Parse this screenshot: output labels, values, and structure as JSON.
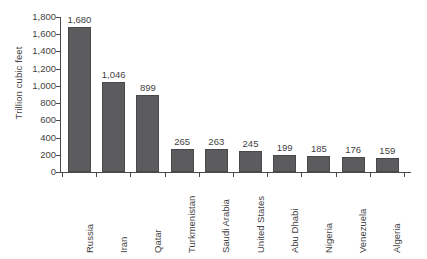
{
  "chart_data": {
    "type": "bar",
    "title": "",
    "subtitle": "",
    "xlabel": "",
    "ylabel": "Trillion cubic feet",
    "ylim": [
      0,
      1800
    ],
    "ytick_step": 200,
    "ytick_labels": [
      "1,800",
      "1,600",
      "1,400",
      "1,200",
      "1,000",
      "800",
      "600",
      "400",
      "200",
      "0"
    ],
    "ytick_values": [
      1800,
      1600,
      1400,
      1200,
      1000,
      800,
      600,
      400,
      200,
      0
    ],
    "grid": false,
    "legend": false,
    "bar_color": "#5c5c5e",
    "axis_color": "#4a4a4a",
    "text_color": "#3f3f3f",
    "background": "#ffffff",
    "categories": [
      "Russia",
      "Iran",
      "Qatar",
      "Turkmenistan",
      "Saudi Arabia",
      "United States",
      "Abu Dhabi",
      "Nigeria",
      "Venezuela",
      "Algeria"
    ],
    "values": [
      1680,
      1046,
      899,
      265,
      263,
      245,
      199,
      185,
      176,
      159
    ],
    "value_labels": [
      "1,680",
      "1,046",
      "899",
      "265",
      "263",
      "245",
      "199",
      "185",
      "176",
      "159"
    ]
  }
}
